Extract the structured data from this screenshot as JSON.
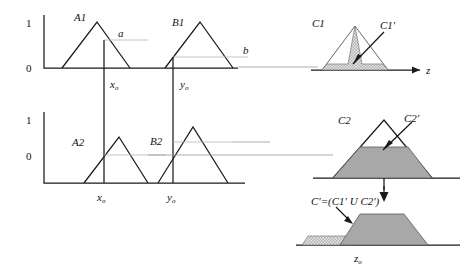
{
  "figure": {
    "title_semantic": "fuzzy-max-min-inference-diagram",
    "colors": {
      "ink": "#1a1a1a",
      "link_line": "#9a9a9a",
      "light_line": "#b5b5b5",
      "fill_light": "#cfcfcf",
      "fill_dark": "#a8a8a8",
      "outline_light": "#555555"
    }
  },
  "axes": {
    "row1": {
      "tick_top": "1",
      "tick_bottom": "0"
    },
    "row2": {
      "tick_top": "1",
      "tick_bottom": "0"
    }
  },
  "panels": {
    "a1": {
      "label": "A1",
      "cut_label": "a",
      "input_label": "x",
      "input_sub": "o"
    },
    "b1": {
      "label": "B1",
      "cut_label": "b",
      "input_label": "y",
      "input_sub": "o"
    },
    "c1": {
      "label": "C1",
      "clipped_label": "C1'",
      "axis_label": "z"
    },
    "a2": {
      "label": "A2",
      "input_label": "x",
      "input_sub": "o"
    },
    "b2": {
      "label": "B2",
      "input_label": "y",
      "input_sub": "o"
    },
    "c2": {
      "label": "C2",
      "clipped_label": "C2'"
    },
    "result": {
      "formula": "C'=(C1' U C2')",
      "axis_label": "z",
      "axis_sub": "o"
    }
  }
}
